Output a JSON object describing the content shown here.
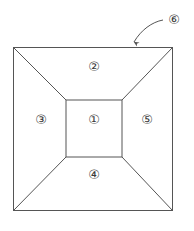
{
  "figure": {
    "stroke_color": "#555555",
    "background_color": "#ffffff",
    "outer_square": {
      "name": "outer-square",
      "x": 13,
      "y": 47,
      "width": 160,
      "height": 164
    },
    "inner_square": {
      "name": "inner-square",
      "x": 66,
      "y": 100,
      "width": 56,
      "height": 57
    },
    "diagonals": [
      {
        "name": "diagonal-top-left",
        "x1": 13,
        "y1": 47,
        "x2": 66,
        "y2": 100
      },
      {
        "name": "diagonal-top-right",
        "x1": 173,
        "y1": 47,
        "x2": 122,
        "y2": 100
      },
      {
        "name": "diagonal-bottom-left",
        "x1": 13,
        "y1": 211,
        "x2": 66,
        "y2": 157
      },
      {
        "name": "diagonal-bottom-right",
        "x1": 173,
        "y1": 211,
        "x2": 122,
        "y2": 157
      }
    ],
    "labels": [
      {
        "name": "label-region-1",
        "text": "①",
        "value": "1",
        "region": "center",
        "x": 86,
        "y": 120
      },
      {
        "name": "label-region-2",
        "text": "②",
        "value": "2",
        "region": "top",
        "x": 86,
        "y": 67
      },
      {
        "name": "label-region-3",
        "text": "③",
        "value": "3",
        "region": "left",
        "x": 33,
        "y": 120
      },
      {
        "name": "label-region-4",
        "text": "④",
        "value": "4",
        "region": "bottom",
        "x": 86,
        "y": 175
      },
      {
        "name": "label-region-5",
        "text": "⑤",
        "value": "5",
        "region": "right",
        "x": 139,
        "y": 120
      }
    ],
    "callout": {
      "name": "callout-6",
      "text": "⑥",
      "value": "6",
      "label_x": 166,
      "label_y": 12,
      "leader_path": "M 163,20 C 152,22 141,30 134,42",
      "arrow_tip_x": 133,
      "arrow_tip_y": 47,
      "points_to": "outer-square-top-edge"
    }
  }
}
